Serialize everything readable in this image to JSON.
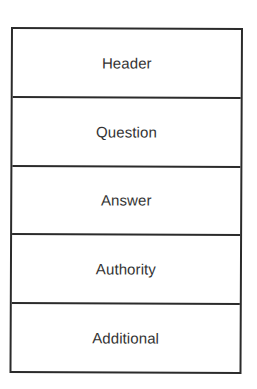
{
  "diagram": {
    "type": "stacked-boxes",
    "sections": [
      {
        "label": "Header"
      },
      {
        "label": "Question"
      },
      {
        "label": "Answer"
      },
      {
        "label": "Authority"
      },
      {
        "label": "Additional"
      }
    ],
    "colors": {
      "border": "#2b2b2b",
      "text": "#333333",
      "background": "#ffffff"
    }
  }
}
